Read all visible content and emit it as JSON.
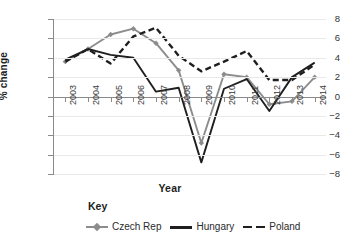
{
  "chart_data": {
    "type": "line",
    "title": "",
    "xlabel": "Year",
    "ylabel": "% change",
    "categories": [
      "2003",
      "2004",
      "2005",
      "2006",
      "2007",
      "2008",
      "2009",
      "2010",
      "2011",
      "2012",
      "2013",
      "2014"
    ],
    "ylim": [
      -8,
      8
    ],
    "yticks": [
      8,
      6,
      4,
      2,
      0,
      -2,
      -4,
      -6,
      -8
    ],
    "ytick_labels": [
      "8",
      "6",
      "4",
      "2",
      "0",
      "−2",
      "−4",
      "−6",
      "−8"
    ],
    "grid": true,
    "legend_position": "bottom",
    "legend_title": "Key",
    "series": [
      {
        "name": "Czech Rep",
        "color": "#8c8c8c",
        "style": "solid-marker",
        "marker": "diamond",
        "values": [
          3.6,
          4.9,
          6.4,
          7.0,
          5.5,
          2.7,
          -4.8,
          2.3,
          2.0,
          -0.8,
          -0.5,
          2.0
        ]
      },
      {
        "name": "Hungary",
        "color": "#1f1f1f",
        "style": "solid",
        "marker": "none",
        "values": [
          3.8,
          4.9,
          4.3,
          4.0,
          0.5,
          0.9,
          -6.8,
          0.8,
          1.8,
          -1.5,
          2.0,
          3.5
        ]
      },
      {
        "name": "Poland",
        "color": "#1f1f1f",
        "style": "dashed",
        "marker": "none",
        "values": [
          3.6,
          4.9,
          3.4,
          6.2,
          7.1,
          4.2,
          2.6,
          3.6,
          4.7,
          1.7,
          1.7,
          3.3
        ]
      }
    ]
  },
  "axis": {
    "xlabel": "Year",
    "ylabel": "% change"
  },
  "legend": {
    "title": "Key",
    "items": [
      {
        "label": "Czech Rep"
      },
      {
        "label": "Hungary"
      },
      {
        "label": "Poland"
      }
    ]
  }
}
